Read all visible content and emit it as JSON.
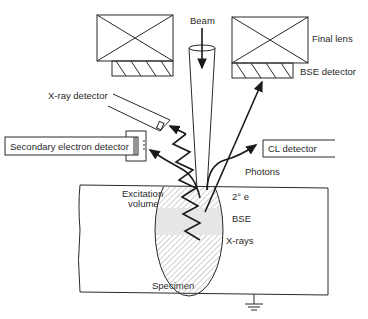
{
  "diagram": {
    "labels": {
      "beam": "Beam",
      "final_lens": "Final lens",
      "bse_detector": "BSE detector",
      "xray_detector": "X-ray detector",
      "secondary_electron_detector": "Secondary electron detector",
      "cl_detector": "CL detector",
      "photons": "Photons",
      "excitation_volume_line1": "Excitation",
      "excitation_volume_line2": "volume",
      "secondary_electrons": "2° e",
      "bse": "BSE",
      "xrays": "X-rays",
      "specimen": "Specimen"
    },
    "components": [
      "beam-column",
      "final-lens-left",
      "final-lens-right",
      "bse-detector-left",
      "bse-detector-right",
      "xray-detector",
      "secondary-electron-detector",
      "cl-detector",
      "specimen-block",
      "excitation-volume",
      "ground-symbol"
    ],
    "colors": {
      "line": "#2a2a2a",
      "bse_zone_fill": "#e6e6e6",
      "background": "#ffffff"
    }
  }
}
